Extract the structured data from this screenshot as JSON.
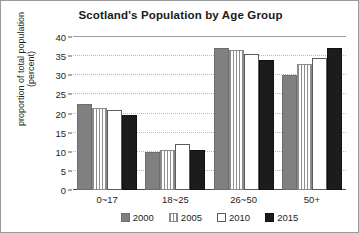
{
  "chart_data": {
    "type": "bar",
    "title": "Scotland's Population by Age Group",
    "xlabel": "",
    "ylabel": "proportion of total population (percent)",
    "ylabel_lines": [
      "proportion of total population",
      "(percent)"
    ],
    "categories": [
      "0~17",
      "18~25",
      "26~50",
      "50+"
    ],
    "series": [
      {
        "name": "2000",
        "values": [
          22.5,
          10.0,
          37.0,
          30.0
        ],
        "color": "#808080",
        "fill": "solid-gray"
      },
      {
        "name": "2005",
        "values": [
          21.5,
          10.5,
          36.5,
          33.0
        ],
        "color": "#8d8d8d",
        "fill": "vertical-stripes"
      },
      {
        "name": "2010",
        "values": [
          21.0,
          12.0,
          35.5,
          34.5
        ],
        "color": "#ffffff",
        "fill": "white-outline"
      },
      {
        "name": "2015",
        "values": [
          19.5,
          10.5,
          34.0,
          37.0
        ],
        "color": "#1c1c1c",
        "fill": "solid-black"
      }
    ],
    "ylim": [
      0,
      40
    ],
    "yticks": [
      0,
      5,
      10,
      15,
      20,
      25,
      30,
      35,
      40
    ],
    "ytick_labels": [
      "0",
      "5",
      "10",
      "15",
      "20",
      "25",
      "30",
      "35",
      "40"
    ],
    "grid": true,
    "grid_axis": "y",
    "grid_style": "dotted",
    "legend_position": "bottom-center",
    "legend_entries": [
      "2000",
      "2005",
      "2010",
      "2015"
    ]
  }
}
